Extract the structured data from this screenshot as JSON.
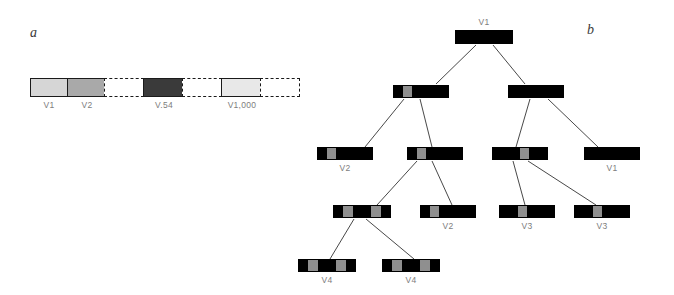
{
  "figure": {
    "panels": [
      {
        "letter": "a"
      },
      {
        "letter": "b"
      }
    ]
  },
  "panel_a": {
    "letter": "a",
    "description": "linear version history bar",
    "colors": {
      "cell_v1": "#d6d6d6",
      "cell_v2": "#a9a9a9",
      "cell_v54": "#3a3a3a",
      "cell_v1000": "#e8e8e8",
      "outline": "#1a1a1a",
      "label_text": "#7d7d7d"
    },
    "cells": [
      {
        "id": "cell-v1",
        "label": "V1",
        "style": "solid",
        "fill": "#d6d6d6",
        "width": 38,
        "labeled": true
      },
      {
        "id": "cell-v2",
        "label": "V2",
        "style": "solid",
        "fill": "#a9a9a9",
        "width": 38,
        "labeled": true
      },
      {
        "id": "gap-1",
        "label": "",
        "style": "dashed",
        "fill": "#ffffff",
        "width": 40,
        "labeled": false
      },
      {
        "id": "cell-v54",
        "label": "V.54",
        "style": "solid",
        "fill": "#3a3a3a",
        "width": 40,
        "labeled": true
      },
      {
        "id": "gap-2",
        "label": "",
        "style": "dashed",
        "fill": "#ffffff",
        "width": 40,
        "labeled": false
      },
      {
        "id": "cell-v1000",
        "label": "V1,000",
        "style": "solid",
        "fill": "#e8e8e8",
        "width": 40,
        "labeled": true
      },
      {
        "id": "gap-3",
        "label": "",
        "style": "dashed",
        "fill": "#ffffff",
        "width": 40,
        "labeled": false
      }
    ]
  },
  "panel_b": {
    "letter": "b",
    "description": "branching version tree",
    "colors": {
      "node_fill": "#000000",
      "marker_fill": "#8f8f8f",
      "edge": "#333333",
      "label_text": "#7d7d7d"
    },
    "nodes": [
      {
        "id": "n-root",
        "label": "V1",
        "label_pos": "above",
        "x": 175,
        "y": 30,
        "w": 58,
        "h": 14,
        "cells": 6,
        "gray_cells": []
      },
      {
        "id": "n-l2a",
        "label": "",
        "label_pos": "below",
        "x": 113,
        "y": 85,
        "w": 56,
        "h": 13,
        "cells": 6,
        "gray_cells": [
          1
        ]
      },
      {
        "id": "n-l2b",
        "label": "",
        "label_pos": "below",
        "x": 228,
        "y": 85,
        "w": 56,
        "h": 13,
        "cells": 6,
        "gray_cells": []
      },
      {
        "id": "n-l3a",
        "label": "V2",
        "label_pos": "below",
        "x": 37,
        "y": 147,
        "w": 56,
        "h": 13,
        "cells": 6,
        "gray_cells": [
          1
        ]
      },
      {
        "id": "n-l3b",
        "label": "",
        "label_pos": "below",
        "x": 127,
        "y": 147,
        "w": 56,
        "h": 13,
        "cells": 6,
        "gray_cells": [
          1
        ]
      },
      {
        "id": "n-l3c",
        "label": "",
        "label_pos": "below",
        "x": 212,
        "y": 147,
        "w": 56,
        "h": 13,
        "cells": 6,
        "gray_cells": [
          3
        ]
      },
      {
        "id": "n-l3d",
        "label": "V1",
        "label_pos": "below",
        "x": 304,
        "y": 147,
        "w": 56,
        "h": 13,
        "cells": 6,
        "gray_cells": []
      },
      {
        "id": "n-l4a",
        "label": "",
        "label_pos": "below",
        "x": 53,
        "y": 205,
        "w": 58,
        "h": 13,
        "cells": 6,
        "gray_cells": [
          1,
          4
        ]
      },
      {
        "id": "n-l4b",
        "label": "V2",
        "label_pos": "below",
        "x": 140,
        "y": 205,
        "w": 56,
        "h": 13,
        "cells": 6,
        "gray_cells": [
          1
        ]
      },
      {
        "id": "n-l4c",
        "label": "V3",
        "label_pos": "below",
        "x": 219,
        "y": 205,
        "w": 56,
        "h": 13,
        "cells": 6,
        "gray_cells": [
          2
        ]
      },
      {
        "id": "n-l4d",
        "label": "V3",
        "label_pos": "below",
        "x": 294,
        "y": 205,
        "w": 56,
        "h": 13,
        "cells": 6,
        "gray_cells": [
          2
        ]
      },
      {
        "id": "n-l5a",
        "label": "V4",
        "label_pos": "below",
        "x": 18,
        "y": 259,
        "w": 58,
        "h": 13,
        "cells": 6,
        "gray_cells": [
          1,
          4
        ]
      },
      {
        "id": "n-l5b",
        "label": "V4",
        "label_pos": "below",
        "x": 102,
        "y": 259,
        "w": 58,
        "h": 13,
        "cells": 6,
        "gray_cells": [
          1,
          4
        ]
      }
    ],
    "edges": [
      {
        "id": "e-root-l2a",
        "x1": 196,
        "y1": 45,
        "x2": 156,
        "y2": 84
      },
      {
        "id": "e-root-l2b",
        "x1": 213,
        "y1": 45,
        "x2": 245,
        "y2": 84
      },
      {
        "id": "e-l2a-l3a",
        "x1": 124,
        "y1": 99,
        "x2": 85,
        "y2": 147
      },
      {
        "id": "e-l2a-l3b",
        "x1": 140,
        "y1": 99,
        "x2": 152,
        "y2": 147
      },
      {
        "id": "e-l2b-l3c",
        "x1": 250,
        "y1": 99,
        "x2": 236,
        "y2": 147
      },
      {
        "id": "e-l2b-l3d",
        "x1": 268,
        "y1": 99,
        "x2": 318,
        "y2": 147
      },
      {
        "id": "e-l3b-l4a",
        "x1": 137,
        "y1": 161,
        "x2": 97,
        "y2": 205
      },
      {
        "id": "e-l3b-l4b",
        "x1": 152,
        "y1": 161,
        "x2": 172,
        "y2": 205
      },
      {
        "id": "e-l3c-l4c",
        "x1": 233,
        "y1": 161,
        "x2": 245,
        "y2": 205
      },
      {
        "id": "e-l3c-l4d",
        "x1": 248,
        "y1": 161,
        "x2": 316,
        "y2": 205
      },
      {
        "id": "e-l4a-l5a",
        "x1": 74,
        "y1": 219,
        "x2": 50,
        "y2": 259
      },
      {
        "id": "e-l4a-l5b",
        "x1": 86,
        "y1": 219,
        "x2": 134,
        "y2": 259
      }
    ]
  }
}
